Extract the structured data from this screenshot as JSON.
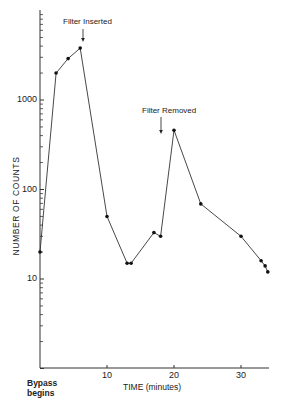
{
  "chart_data": {
    "type": "line",
    "title": "",
    "xlabel": "TIME (minutes)",
    "ylabel": "NUMBER OF COUNTS",
    "yscale": "log",
    "xlim": [
      0,
      34
    ],
    "ylim": [
      1,
      10000
    ],
    "x_ticks": [
      10,
      20,
      30
    ],
    "x_tick_labels": [
      "10",
      "20",
      "30"
    ],
    "y_ticks": [
      10,
      100,
      1000
    ],
    "y_tick_labels": [
      "10",
      "100",
      "1000"
    ],
    "grid": false,
    "legend": null,
    "x_origin_label": [
      "Bypass",
      "begins"
    ],
    "series": [
      {
        "name": "counts",
        "x": [
          0,
          2.4,
          4.2,
          6.0,
          10,
          13,
          13.6,
          17,
          18,
          20,
          24,
          30,
          33,
          33.6,
          34
        ],
        "y": [
          20,
          2000,
          2900,
          3800,
          50,
          15,
          15,
          33,
          30,
          460,
          69,
          30,
          16,
          14,
          12
        ]
      }
    ],
    "annotations": [
      {
        "text": "Filter Inserted",
        "x": 6.4,
        "arrow": true
      },
      {
        "text": "Filter Removed",
        "x": 18,
        "arrow": true
      }
    ]
  }
}
